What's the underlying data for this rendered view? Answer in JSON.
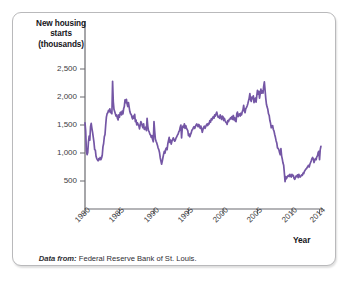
{
  "figure": {
    "y_axis_title": "New housing\nstarts\n(thousands)",
    "x_axis_title": "Year",
    "source_label": "Data from:",
    "source_text": " Federal Reserve Bank of St. Louis.",
    "line_color": "#7456a5",
    "axis_color": "#6b6b70",
    "text_color": "#2e2d33"
  },
  "chart_data": {
    "type": "line",
    "title": "",
    "subtitle": "",
    "xlabel": "Year",
    "ylabel": "New housing starts (thousands)",
    "xlim": [
      1980,
      2014.5
    ],
    "ylim": [
      0,
      2700
    ],
    "grid": false,
    "legend": "none",
    "series_color": "#7456a5",
    "y_ticks": [
      500,
      1000,
      1500,
      2000,
      2500
    ],
    "y_tick_labels": [
      "500",
      "1,000",
      "1,500",
      "2,000",
      "2,500"
    ],
    "x_ticks": [
      1980,
      1985,
      1990,
      1995,
      2000,
      2005,
      2010,
      2014
    ],
    "x_tick_labels": [
      "1980",
      "1985",
      "1990",
      "1995",
      "2000",
      "2005",
      "2010",
      "2014"
    ],
    "annotations": [
      "Peak ~2,280 in early 1984",
      "Trough ~800 in early 1991",
      "Peak ~2,270 in early 2006",
      "Trough ~490 in 2009"
    ],
    "series": [
      {
        "name": "New housing starts (thousands)",
        "x": [
          1980.0,
          1980.1,
          1980.2,
          1980.3,
          1980.4,
          1980.5,
          1980.6,
          1980.7,
          1980.8,
          1980.9,
          1981.0,
          1981.1,
          1981.2,
          1981.3,
          1981.4,
          1981.5,
          1981.6,
          1981.7,
          1981.8,
          1981.9,
          1982.0,
          1982.1,
          1982.2,
          1982.3,
          1982.4,
          1982.5,
          1982.6,
          1982.7,
          1982.8,
          1982.9,
          1983.0,
          1983.1,
          1983.2,
          1983.3,
          1983.4,
          1983.5,
          1983.6,
          1983.7,
          1983.8,
          1983.9,
          1984.0,
          1984.1,
          1984.2,
          1984.3,
          1984.4,
          1984.5,
          1984.6,
          1984.7,
          1984.8,
          1984.9,
          1985.0,
          1985.1,
          1985.2,
          1985.3,
          1985.4,
          1985.5,
          1985.6,
          1985.7,
          1985.8,
          1985.9,
          1986.0,
          1986.1,
          1986.2,
          1986.3,
          1986.4,
          1986.5,
          1986.6,
          1986.7,
          1986.8,
          1986.9,
          1987.0,
          1987.1,
          1987.2,
          1987.3,
          1987.4,
          1987.5,
          1987.6,
          1987.7,
          1987.8,
          1987.9,
          1988.0,
          1988.1,
          1988.2,
          1988.3,
          1988.4,
          1988.5,
          1988.6,
          1988.7,
          1988.8,
          1988.9,
          1989.0,
          1989.1,
          1989.2,
          1989.3,
          1989.4,
          1989.5,
          1989.6,
          1989.7,
          1989.8,
          1989.9,
          1990.0,
          1990.1,
          1990.2,
          1990.3,
          1990.4,
          1990.5,
          1990.6,
          1990.7,
          1990.8,
          1990.9,
          1991.0,
          1991.1,
          1991.2,
          1991.3,
          1991.4,
          1991.5,
          1991.6,
          1991.7,
          1991.8,
          1991.9,
          1992.0,
          1992.1,
          1992.2,
          1992.3,
          1992.4,
          1992.5,
          1992.6,
          1992.7,
          1992.8,
          1992.9,
          1993.0,
          1993.1,
          1993.2,
          1993.3,
          1993.4,
          1993.5,
          1993.6,
          1993.7,
          1993.8,
          1993.9,
          1994.0,
          1994.1,
          1994.2,
          1994.3,
          1994.4,
          1994.5,
          1994.6,
          1994.7,
          1994.8,
          1994.9,
          1995.0,
          1995.1,
          1995.2,
          1995.3,
          1995.4,
          1995.5,
          1995.6,
          1995.7,
          1995.8,
          1995.9,
          1996.0,
          1996.1,
          1996.2,
          1996.3,
          1996.4,
          1996.5,
          1996.6,
          1996.7,
          1996.8,
          1996.9,
          1997.0,
          1997.1,
          1997.2,
          1997.3,
          1997.4,
          1997.5,
          1997.6,
          1997.7,
          1997.8,
          1997.9,
          1998.0,
          1998.1,
          1998.2,
          1998.3,
          1998.4,
          1998.5,
          1998.6,
          1998.7,
          1998.8,
          1998.9,
          1999.0,
          1999.1,
          1999.2,
          1999.3,
          1999.4,
          1999.5,
          1999.6,
          1999.7,
          1999.8,
          1999.9,
          2000.0,
          2000.1,
          2000.2,
          2000.3,
          2000.4,
          2000.5,
          2000.6,
          2000.7,
          2000.8,
          2000.9,
          2001.0,
          2001.1,
          2001.2,
          2001.3,
          2001.4,
          2001.5,
          2001.6,
          2001.7,
          2001.8,
          2001.9,
          2002.0,
          2002.1,
          2002.2,
          2002.3,
          2002.4,
          2002.5,
          2002.6,
          2002.7,
          2002.8,
          2002.9,
          2003.0,
          2003.1,
          2003.2,
          2003.3,
          2003.4,
          2003.5,
          2003.6,
          2003.7,
          2003.8,
          2003.9,
          2004.0,
          2004.1,
          2004.2,
          2004.3,
          2004.4,
          2004.5,
          2004.6,
          2004.7,
          2004.8,
          2004.9,
          2005.0,
          2005.1,
          2005.2,
          2005.3,
          2005.4,
          2005.5,
          2005.6,
          2005.7,
          2005.8,
          2005.9,
          2006.0,
          2006.1,
          2006.2,
          2006.3,
          2006.4,
          2006.5,
          2006.6,
          2006.7,
          2006.8,
          2006.9,
          2007.0,
          2007.1,
          2007.2,
          2007.3,
          2007.4,
          2007.5,
          2007.6,
          2007.7,
          2007.8,
          2007.9,
          2008.0,
          2008.1,
          2008.2,
          2008.3,
          2008.4,
          2008.5,
          2008.6,
          2008.7,
          2008.8,
          2008.9,
          2009.0,
          2009.1,
          2009.2,
          2009.3,
          2009.4,
          2009.5,
          2009.6,
          2009.7,
          2009.8,
          2009.9,
          2010.0,
          2010.1,
          2010.2,
          2010.3,
          2010.4,
          2010.5,
          2010.6,
          2010.7,
          2010.8,
          2010.9,
          2011.0,
          2011.1,
          2011.2,
          2011.3,
          2011.4,
          2011.5,
          2011.6,
          2011.7,
          2011.8,
          2011.9,
          2012.0,
          2012.1,
          2012.2,
          2012.3,
          2012.4,
          2012.5,
          2012.6,
          2012.7,
          2012.8,
          2012.9,
          2013.0,
          2013.1,
          2013.2,
          2013.3,
          2013.4,
          2013.5,
          2013.6,
          2013.7,
          2013.8,
          2013.9,
          2014.0,
          2014.1,
          2014.2
        ],
        "values": [
          1540,
          1390,
          1040,
          970,
          1010,
          1200,
          1300,
          1230,
          1470,
          1530,
          1440,
          1370,
          1280,
          1190,
          1060,
          1050,
          940,
          900,
          880,
          860,
          900,
          880,
          920,
          880,
          910,
          960,
          1110,
          1170,
          1290,
          1330,
          1500,
          1640,
          1700,
          1720,
          1760,
          1740,
          1790,
          1720,
          1730,
          1700,
          2280,
          1920,
          1780,
          1740,
          1700,
          1660,
          1680,
          1620,
          1590,
          1680,
          1640,
          1720,
          1730,
          1680,
          1750,
          1700,
          1790,
          1830,
          1950,
          1900,
          1960,
          1880,
          1830,
          1900,
          1820,
          1740,
          1700,
          1690,
          1640,
          1610,
          1660,
          1620,
          1690,
          1560,
          1590,
          1500,
          1540,
          1510,
          1490,
          1430,
          1500,
          1560,
          1530,
          1480,
          1450,
          1520,
          1420,
          1440,
          1460,
          1400,
          1620,
          1480,
          1400,
          1380,
          1340,
          1320,
          1280,
          1310,
          1240,
          1200,
          1560,
          1390,
          1250,
          1210,
          1180,
          1140,
          1090,
          1060,
          1010,
          920,
          860,
          800,
          850,
          920,
          980,
          1030,
          1000,
          1070,
          1090,
          1060,
          1160,
          1220,
          1280,
          1190,
          1230,
          1160,
          1210,
          1240,
          1270,
          1240,
          1210,
          1230,
          1270,
          1290,
          1320,
          1340,
          1380,
          1400,
          1460,
          1500,
          1270,
          1440,
          1480,
          1460,
          1520,
          1440,
          1490,
          1450,
          1420,
          1400,
          1310,
          1340,
          1290,
          1330,
          1360,
          1410,
          1420,
          1450,
          1470,
          1440,
          1470,
          1500,
          1520,
          1490,
          1470,
          1510,
          1480,
          1440,
          1480,
          1430,
          1370,
          1420,
          1460,
          1480,
          1440,
          1470,
          1500,
          1520,
          1490,
          1530,
          1520,
          1580,
          1550,
          1610,
          1590,
          1630,
          1650,
          1620,
          1680,
          1660,
          1700,
          1730,
          1680,
          1640,
          1650,
          1620,
          1680,
          1640,
          1600,
          1660,
          1650,
          1580,
          1620,
          1580,
          1550,
          1540,
          1510,
          1580,
          1560,
          1600,
          1600,
          1630,
          1610,
          1650,
          1600,
          1670,
          1590,
          1630,
          1570,
          1560,
          1700,
          1730,
          1650,
          1690,
          1700,
          1660,
          1710,
          1680,
          1740,
          1770,
          1850,
          1750,
          1720,
          1790,
          1810,
          1840,
          1880,
          1930,
          1980,
          2060,
          1950,
          1920,
          2000,
          1970,
          2020,
          1900,
          1940,
          1980,
          1910,
          2020,
          2120,
          2050,
          2100,
          1980,
          2060,
          2140,
          2070,
          2110,
          2070,
          2190,
          2270,
          2130,
          1980,
          1870,
          1820,
          1780,
          1700,
          1670,
          1580,
          1530,
          1450,
          1480,
          1490,
          1420,
          1390,
          1330,
          1280,
          1220,
          1180,
          1090,
          1080,
          1060,
          1010,
          970,
          1080,
          950,
          890,
          820,
          780,
          640,
          490,
          580,
          540,
          570,
          590,
          600,
          580,
          620,
          590,
          570,
          620,
          590,
          600,
          550,
          530,
          560,
          590,
          580,
          610,
          560,
          620,
          580,
          570,
          590,
          610,
          600,
          640,
          630,
          670,
          690,
          710,
          720,
          740,
          760,
          780,
          750,
          800,
          830,
          860,
          900,
          920,
          890,
          830,
          870,
          900,
          880,
          930,
          950,
          1010,
          1030,
          880,
          1060,
          1120
        ]
      }
    ]
  }
}
